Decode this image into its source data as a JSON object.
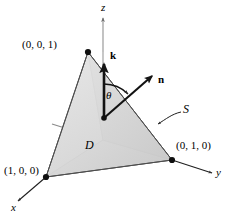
{
  "figure": {
    "background_color": "#ffffff",
    "axes": [
      {
        "name": "z-axis",
        "label": "z",
        "label_x": 103,
        "label_y": 7
      },
      {
        "name": "y-axis",
        "label": "y",
        "label_x": 217,
        "label_y": 171
      },
      {
        "name": "x-axis",
        "label": "x",
        "label_x": 12,
        "label_y": 206
      }
    ],
    "vertices": [
      {
        "name": "vertex-z",
        "label": "(0, 0, 1)",
        "point_x": 88,
        "point_y": 52,
        "label_x": 22,
        "label_y": 44
      },
      {
        "name": "vertex-x",
        "label": "(1, 0, 0)",
        "point_x": 46,
        "point_y": 177,
        "label_x": 4,
        "label_y": 170
      },
      {
        "name": "vertex-y",
        "label": "(0, 1, 0)",
        "point_x": 172,
        "point_y": 160,
        "label_x": 177,
        "label_y": 145
      }
    ],
    "vectors": [
      {
        "name": "k-vector",
        "label": "k",
        "tail_x": 104,
        "tail_y": 118,
        "tip_x": 104,
        "tip_y": 60,
        "label_x": 111,
        "label_y": 54
      },
      {
        "name": "n-vector",
        "label": "n",
        "tail_x": 104,
        "tail_y": 118,
        "tip_x": 155,
        "tip_y": 73,
        "label_x": 160,
        "label_y": 80
      }
    ],
    "annotations": [
      {
        "name": "theta-angle",
        "label": "θ",
        "label_x": 107,
        "label_y": 95
      },
      {
        "name": "region-d",
        "label": "D",
        "label_x": 86,
        "label_y": 145
      },
      {
        "name": "surface-s",
        "label": "S",
        "label_x": 185,
        "label_y": 111
      }
    ],
    "colors": {
      "stroke": "#1a1a1a",
      "axis_gray": "#8f8f8f",
      "face_front_top": "#e3e3e3",
      "face_front_bottom": "#cfcfcf",
      "face_left": "#c9c9c9",
      "face_base": "#b8b8b8",
      "face_base_dark": "#a8a8a8",
      "edge": "#5a5a5a"
    }
  }
}
